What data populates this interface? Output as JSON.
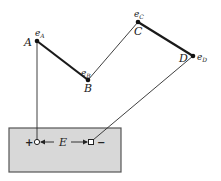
{
  "diagram": {
    "points": {
      "A": {
        "label": "A",
        "potential": "e",
        "potential_sub": "A"
      },
      "B": {
        "label": "B",
        "potential": "e",
        "potential_sub": "B"
      },
      "C": {
        "label": "C",
        "potential": "e",
        "potential_sub": "C"
      },
      "D": {
        "label": "D",
        "potential": "e",
        "potential_sub": "D"
      }
    },
    "source": {
      "emf_label": "E",
      "positive_sign": "+",
      "negative_sign": "−"
    },
    "colors": {
      "line": "#2a2a2a",
      "box_fill": "#d8d8d8",
      "box_stroke": "#555555"
    }
  }
}
